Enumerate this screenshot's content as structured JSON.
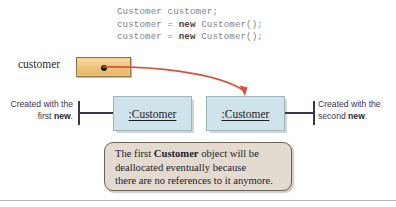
{
  "figure": {
    "background_color": "#ffffff"
  },
  "code": {
    "line1": "Customer customer;",
    "line2_prefix": "customer = ",
    "line2_keyword": "new",
    "line2_suffix": " Customer();",
    "line3_prefix": "customer = ",
    "line3_keyword": "new",
    "line3_suffix": " Customer();",
    "text_color": "#8a7f78",
    "keyword_color": "#4d4540"
  },
  "variable": {
    "label": "customer",
    "box_fill": "#efc177",
    "box_border": "#8c7a4a",
    "dot_color": "#1a1a1a"
  },
  "objects": {
    "first": {
      "label": ":Customer"
    },
    "second": {
      "label": ":Customer"
    },
    "fill": "#cfe3ea",
    "border": "#9fb4bd"
  },
  "annotations": {
    "left": {
      "line1": "Created with the",
      "line2_prefix": "first ",
      "line2_bold": "new",
      "line2_suffix": "."
    },
    "right": {
      "line1": "Created with the",
      "line2_prefix": "second ",
      "line2_bold": "new",
      "line2_suffix": "."
    },
    "color": "#3b3550"
  },
  "arrow": {
    "color": "#d4543a",
    "description": "reference-arrow-from-customer-to-second-object"
  },
  "callout": {
    "line1_prefix": "The first ",
    "line1_bold": "Customer",
    "line1_suffix": " object will be",
    "line2": "deallocated eventually because",
    "line3": "there are no references to it anymore.",
    "fill": "#e4dbd0",
    "border": "#6d6257"
  }
}
